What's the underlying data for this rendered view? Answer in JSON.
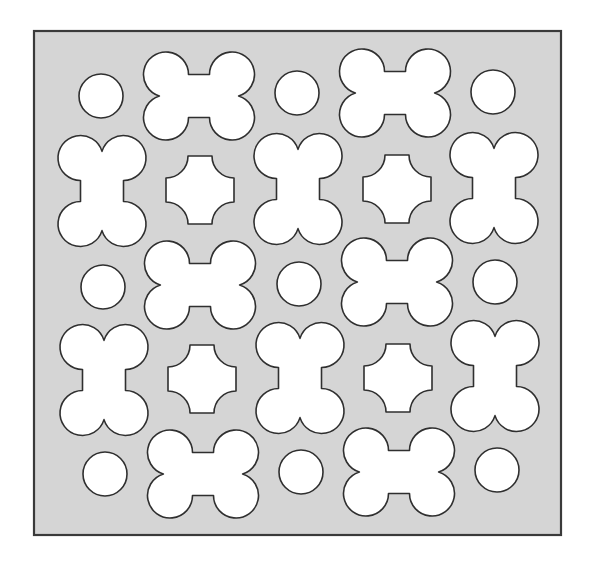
{
  "diagram": {
    "title": "",
    "colors": {
      "page_background": "#ffffff",
      "panel_fill": "#d5d5d5",
      "panel_border": "#3a3a3a",
      "hole_fill": "#ffffff",
      "hole_stroke": "#2f2f2f"
    },
    "panel": {
      "x": 34,
      "y": 31,
      "width": 527,
      "height": 504
    },
    "shape_params": {
      "circle_radius": 22,
      "bone_lobe_radius": 22.5,
      "bone_lobe_dx": 33,
      "bone_lobe_dy": 21.5,
      "cross_half_size": 34,
      "cross_corner_radius": 22
    },
    "shapes": [
      {
        "type": "circle",
        "cx": 101,
        "cy": 96
      },
      {
        "type": "hbone",
        "cx": 199,
        "cy": 96
      },
      {
        "type": "circle",
        "cx": 297,
        "cy": 93
      },
      {
        "type": "hbone",
        "cx": 395,
        "cy": 93
      },
      {
        "type": "circle",
        "cx": 493,
        "cy": 92
      },
      {
        "type": "vbone",
        "cx": 102,
        "cy": 191
      },
      {
        "type": "cross",
        "cx": 200,
        "cy": 190
      },
      {
        "type": "vbone",
        "cx": 298,
        "cy": 189
      },
      {
        "type": "cross",
        "cx": 397,
        "cy": 189
      },
      {
        "type": "vbone",
        "cx": 494,
        "cy": 188
      },
      {
        "type": "circle",
        "cx": 103,
        "cy": 287
      },
      {
        "type": "hbone",
        "cx": 200,
        "cy": 285
      },
      {
        "type": "circle",
        "cx": 299,
        "cy": 284
      },
      {
        "type": "hbone",
        "cx": 397,
        "cy": 282
      },
      {
        "type": "circle",
        "cx": 495,
        "cy": 282
      },
      {
        "type": "vbone",
        "cx": 104,
        "cy": 380
      },
      {
        "type": "cross",
        "cx": 202,
        "cy": 379
      },
      {
        "type": "vbone",
        "cx": 300,
        "cy": 378
      },
      {
        "type": "cross",
        "cx": 398,
        "cy": 378
      },
      {
        "type": "vbone",
        "cx": 495,
        "cy": 376
      },
      {
        "type": "circle",
        "cx": 105,
        "cy": 474
      },
      {
        "type": "hbone",
        "cx": 203,
        "cy": 474
      },
      {
        "type": "circle",
        "cx": 301,
        "cy": 472
      },
      {
        "type": "hbone",
        "cx": 399,
        "cy": 472
      },
      {
        "type": "circle",
        "cx": 497,
        "cy": 470
      }
    ]
  }
}
